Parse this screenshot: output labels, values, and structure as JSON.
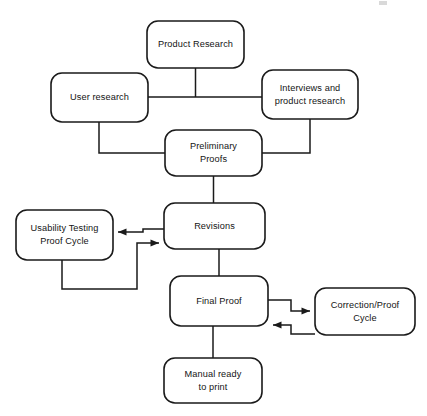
{
  "diagram": {
    "type": "flowchart",
    "orientation": "top-to-bottom",
    "background_color": "#ffffff",
    "line_color": "#1a1a1a",
    "text_color": "#141414",
    "nodes": [
      {
        "id": "product-research",
        "label_line1": "Product Research",
        "label_line2": "",
        "x": 147,
        "y": 21,
        "w": 97,
        "h": 47
      },
      {
        "id": "user-research",
        "label_line1": "User research",
        "label_line2": "",
        "x": 51,
        "y": 73,
        "w": 97,
        "h": 49
      },
      {
        "id": "interviews-and-product-research",
        "label_line1": "Interviews and",
        "label_line2": "product research",
        "x": 262,
        "y": 70,
        "w": 96,
        "h": 49
      },
      {
        "id": "preliminary-proofs",
        "label_line1": "Preliminary",
        "label_line2": "Proofs",
        "x": 165,
        "y": 130,
        "w": 97,
        "h": 46
      },
      {
        "id": "revisions",
        "label_line1": "Revisions",
        "label_line2": "",
        "x": 164,
        "y": 203,
        "w": 101,
        "h": 46
      },
      {
        "id": "usability-testing-proof-cycle",
        "label_line1": "Usability Testing",
        "label_line2": "Proof Cycle",
        "x": 16,
        "y": 210,
        "w": 97,
        "h": 50
      },
      {
        "id": "final-proof",
        "label_line1": "Final Proof",
        "label_line2": "",
        "x": 170,
        "y": 276,
        "w": 98,
        "h": 50
      },
      {
        "id": "correction-proof-cycle",
        "label_line1": "Correction/Proof",
        "label_line2": "Cycle",
        "x": 315,
        "y": 288,
        "w": 100,
        "h": 47
      },
      {
        "id": "manual-ready-to-print",
        "label_line1": "Manual ready",
        "label_line2": "to print",
        "x": 164,
        "y": 358,
        "w": 98,
        "h": 45
      }
    ],
    "edges": [
      {
        "id": "edge-user-research-to-interviews",
        "from": "user-research",
        "to": "interviews-and-product-research",
        "arrow": false,
        "path": "M 148 97 L 262 97"
      },
      {
        "id": "edge-product-research-to-trunk",
        "from": "product-research",
        "to": "user-research",
        "arrow": false,
        "path": "M 195.5 68 L 195.5 97"
      },
      {
        "id": "edge-user-research-to-preliminary-proofs",
        "from": "user-research",
        "to": "preliminary-proofs",
        "arrow": false,
        "path": "M 99 122 L 99 153 L 165 153"
      },
      {
        "id": "edge-interviews-to-preliminary-proofs",
        "from": "interviews-and-product-research",
        "to": "preliminary-proofs",
        "arrow": false,
        "path": "M 310 119 L 310 153 L 262 153"
      },
      {
        "id": "edge-preliminary-proofs-to-revisions",
        "from": "preliminary-proofs",
        "to": "revisions",
        "arrow": false,
        "path": "M 213.5 176 L 213.5 203"
      },
      {
        "id": "edge-revisions-to-usability-testing",
        "from": "revisions",
        "to": "usability-testing-proof-cycle",
        "arrow": true,
        "path": "M 164 229 L 143 229 L 143 232 L 118 232"
      },
      {
        "id": "edge-usability-testing-to-revisions",
        "from": "usability-testing-proof-cycle",
        "to": "revisions",
        "arrow": true,
        "path": "M 62 260 L 62 289 L 137 289 L 137 243 L 159 243"
      },
      {
        "id": "edge-revisions-to-final-proof",
        "from": "revisions",
        "to": "final-proof",
        "arrow": false,
        "path": "M 219 249 L 219 276"
      },
      {
        "id": "edge-final-proof-to-correction-cycle",
        "from": "final-proof",
        "to": "correction-proof-cycle",
        "arrow": true,
        "path": "M 268 300 L 291 300 L 291 311 L 310 311"
      },
      {
        "id": "edge-correction-cycle-to-final-proof",
        "from": "correction-proof-cycle",
        "to": "final-proof",
        "arrow": true,
        "path": "M 315 334 L 291 334 L 291 325 L 273 325"
      },
      {
        "id": "edge-final-proof-to-manual-ready",
        "from": "final-proof",
        "to": "manual-ready-to-print",
        "arrow": false,
        "path": "M 213 326 L 213 358"
      }
    ]
  }
}
